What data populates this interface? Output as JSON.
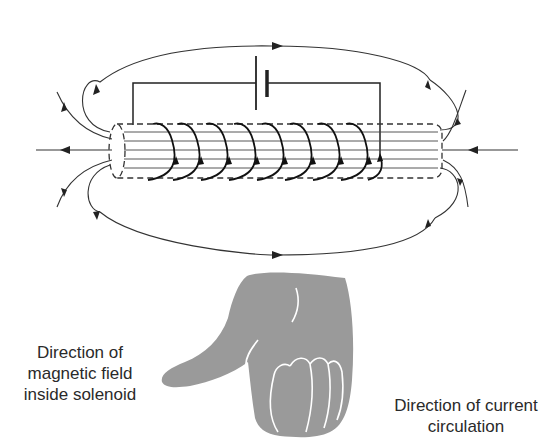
{
  "diagram": {
    "type": "solenoid-right-hand-rule",
    "components": {
      "battery": "battery-icon",
      "solenoid_turns": 9,
      "field_lines": "magnetic-field-lines",
      "hand": "right-hand-grip-icon"
    },
    "colors": {
      "line": "#222222",
      "hand": "#9a9a9a",
      "text": "#2a2a2a"
    }
  },
  "labels": {
    "field_line1": "Direction of",
    "field_line2": "magnetic field",
    "field_line3": "inside solenoid",
    "current_line1": "Direction of current",
    "current_line2": "circulation"
  }
}
